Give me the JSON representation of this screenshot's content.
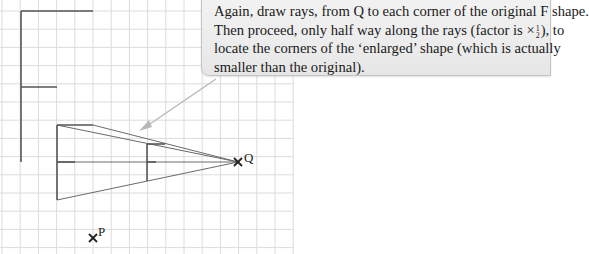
{
  "callout": {
    "line1": "Again, draw rays, from Q to each corner of the original F shape.",
    "line2_before": "Then proceed, only half way along the rays (factor is ×",
    "fraction_num": "1",
    "fraction_den": "2",
    "line2_after": "), to",
    "line3": "locate the corners of the ‘enlarged’ shape (which is actually",
    "line4": "smaller than the original)."
  },
  "points": {
    "Q": {
      "label": "Q",
      "x": 238,
      "y": 162
    },
    "P": {
      "label": "P",
      "x": 93,
      "y": 238
    }
  },
  "grid": {
    "x0": 2,
    "y0": 11,
    "spacing": 18.2,
    "cols": 16,
    "rows": 13,
    "color": "#d9d9d9"
  },
  "shapes": {
    "original_F": {
      "stem_x": 21,
      "top_y": 11,
      "bottom_y": 162,
      "top_arm_x": 93,
      "mid_y": 87,
      "mid_arm_x": 57
    },
    "second_F": {
      "stem_x": 57,
      "top_y": 125,
      "bottom_y": 200,
      "top_arm_x": 93,
      "mid_y": 162,
      "mid_arm_x": 75
    },
    "small_F": {
      "stem_x": 147,
      "top_y": 144,
      "bottom_y": 181,
      "top_arm_x": 165,
      "mid_y": 162,
      "mid_arm_x": 156
    }
  },
  "colors": {
    "shape": "#555555",
    "ray": "#666666",
    "arrow": "#b5b5b5",
    "marker": "#222222"
  }
}
